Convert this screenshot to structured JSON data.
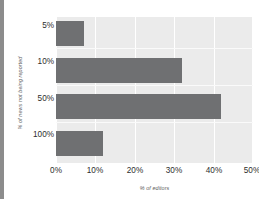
{
  "chart_data": {
    "type": "bar",
    "orientation": "horizontal",
    "title": "",
    "xlabel": "% of editors",
    "ylabel": "% of news not being reported",
    "categories": [
      "5%",
      "10%",
      "50%",
      "100%"
    ],
    "values": [
      7,
      32,
      42,
      12
    ],
    "xlim": [
      0,
      50
    ],
    "xticks": [
      "0%",
      "10%",
      "20%",
      "30%",
      "40%",
      "50%"
    ],
    "xtick_values": [
      0,
      10,
      20,
      30,
      40,
      50
    ],
    "grid": true,
    "legend": null,
    "series": [
      {
        "name": "% of editors",
        "values": [
          7,
          32,
          42,
          12
        ]
      }
    ],
    "colors": {
      "bar": "#6f7072",
      "plot_background": "#ebebeb",
      "gridline": "#ffffff",
      "tick_text": "#2d2d2d",
      "axis_title_text": "#5e5e5e",
      "page_background": "#ffffff"
    }
  }
}
